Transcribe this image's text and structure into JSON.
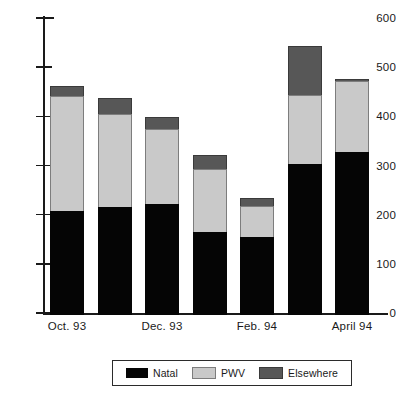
{
  "chart_data": {
    "type": "bar",
    "subtype": "stacked-bar",
    "title": "",
    "xlabel": "",
    "ylabel": "",
    "ylim": [
      0,
      600
    ],
    "ytick_values": [
      0,
      100,
      200,
      300,
      400,
      500,
      600
    ],
    "ytick_labels": [
      "0",
      "100",
      "200",
      "300",
      "400",
      "500",
      "600"
    ],
    "grid": false,
    "legend_position": "bottom",
    "categories": [
      "Oct. 93",
      "",
      "Dec. 93",
      "",
      "Feb. 94",
      "",
      "April 94"
    ],
    "xtick_labels": [
      "Oct. 93",
      "Dec. 93",
      "Feb. 94",
      "April 94"
    ],
    "xtick_label_bar_index": [
      0,
      2,
      4,
      6
    ],
    "series": [
      {
        "name": "Natal",
        "color": "#050505",
        "values": [
          212,
          220,
          226,
          169,
          159,
          307,
          331
        ]
      },
      {
        "name": "PWV",
        "color": "#c9c9c9",
        "values": [
          233,
          189,
          152,
          128,
          63,
          140,
          145
        ]
      },
      {
        "name": "Elsewhere",
        "color": "#575757",
        "values": [
          20,
          33,
          25,
          28,
          16,
          101,
          4
        ]
      }
    ],
    "totals": [
      465,
      442,
      403,
      325,
      238,
      548,
      480
    ]
  },
  "legend": {
    "entries": [
      {
        "label": "Natal",
        "swatch": "swatch-natal-icon"
      },
      {
        "label": "PWV",
        "swatch": "swatch-pwv-icon"
      },
      {
        "label": "Elsewhere",
        "swatch": "swatch-elsewhere-icon"
      }
    ]
  }
}
